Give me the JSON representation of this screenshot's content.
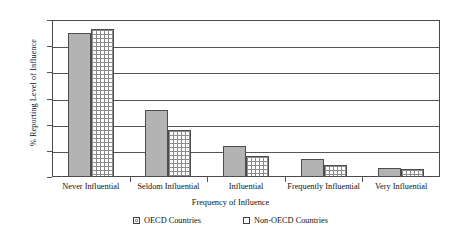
{
  "chart_data": {
    "type": "bar",
    "title": "",
    "xlabel": "Frequency of Influence",
    "ylabel": "% Reporting Level of Influence",
    "categories": [
      "Never Influential",
      "Seldom Influential",
      "Influential",
      "Frequently Influential",
      "Very Influential"
    ],
    "series": [
      {
        "name": "OECD Countries",
        "values": [
          55,
          25.5,
          12,
          7,
          3.5
        ]
      },
      {
        "name": "Non-OECD Countries",
        "values": [
          56.5,
          18,
          8,
          4.5,
          3
        ]
      }
    ],
    "ylim": [
      0,
      60
    ],
    "yticks": [
      0,
      10,
      20,
      30,
      40,
      50,
      60
    ],
    "ytick_labels": [
      "0",
      "10",
      "20",
      "30",
      "40",
      "50",
      "60"
    ],
    "grid": true,
    "grid_axis": "y",
    "legend_position": "bottom",
    "colors": {
      "oecd_fill": "#b3b3b3",
      "nonoecd_fill": "#ffffff",
      "bar_border": "#4d4d4d",
      "axis": "#555555",
      "text": "#111111",
      "background": "#ffffff"
    }
  },
  "legend": {
    "items": [
      {
        "label": "OECD Countries",
        "swatch": "filled-gray-square-icon"
      },
      {
        "label": "Non-OECD Countries",
        "swatch": "hatched-white-square-icon"
      }
    ]
  }
}
